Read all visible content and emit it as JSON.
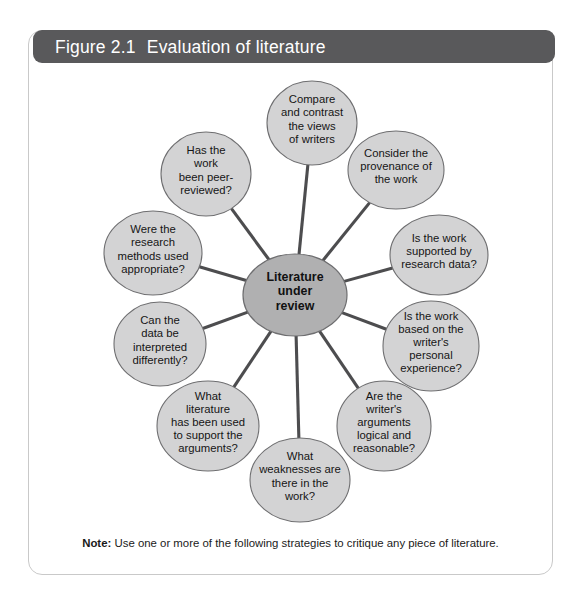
{
  "figure": {
    "title_number": "Figure 2.1",
    "title_text": "Evaluation of literature",
    "note_label": "Note:",
    "note_text": "Use one or more of the following strategies to critique any piece of literature."
  },
  "colors": {
    "title_bar": "#59595b",
    "title_text": "#ffffff",
    "frame_border": "#c9c9c9",
    "node_fill": "#d3d3d4",
    "node_stroke": "#6e6e70",
    "center_fill": "#b0b0b1",
    "spoke": "#4d4d4f",
    "page_background": "#ffffff"
  },
  "chart_data": {
    "type": "diagram",
    "diagram_kind": "radial-hub-and-spoke",
    "center": {
      "id": "literature-under-review",
      "label": "Literature under review",
      "lines": [
        "Literature",
        "under",
        "review"
      ],
      "cx": 267,
      "cy": 232,
      "rx": 52,
      "ry": 41
    },
    "nodes": [
      {
        "id": "compare-contrast-views",
        "label": "Compare and contrast the views of writers",
        "lines": [
          "Compare",
          "and contrast",
          "the views",
          "of writers"
        ],
        "angle_deg": 90,
        "cx": 284,
        "cy": 60,
        "rx": 45,
        "ry": 42
      },
      {
        "id": "consider-provenance",
        "label": "Consider the provenance of the work",
        "lines": [
          "Consider the",
          "provenance of",
          "the work"
        ],
        "angle_deg": 54,
        "cx": 368,
        "cy": 107,
        "rx": 48,
        "ry": 39
      },
      {
        "id": "supported-by-research-data",
        "label": "Is the work supported by research data?",
        "lines": [
          "Is the work",
          "supported by",
          "research data?"
        ],
        "angle_deg": 18,
        "cx": 411,
        "cy": 192,
        "rx": 49,
        "ry": 40
      },
      {
        "id": "based-on-personal-experience",
        "label": "Is the work based on the writer's personal experience?",
        "lines": [
          "Is the work",
          "based on the",
          "writer's",
          "personal",
          "experience?"
        ],
        "angle_deg": -18,
        "cx": 403,
        "cy": 283,
        "rx": 48,
        "ry": 45
      },
      {
        "id": "arguments-logical-reasonable",
        "label": "Are the writer's arguments logical and reasonable?",
        "lines": [
          "Are the",
          "writer's",
          "arguments",
          "logical and",
          "reasonable?"
        ],
        "angle_deg": -54,
        "cx": 356,
        "cy": 363,
        "rx": 47,
        "ry": 45
      },
      {
        "id": "weaknesses-in-work",
        "label": "What weaknesses are there in the work?",
        "lines": [
          "What",
          "weaknesses are",
          "there in the",
          "work?"
        ],
        "angle_deg": -90,
        "cx": 272,
        "cy": 417,
        "rx": 50,
        "ry": 42
      },
      {
        "id": "literature-supporting-arguments",
        "label": "What literature has been used to support the arguments?",
        "lines": [
          "What",
          "literature",
          "has been used",
          "to support the",
          "arguments?"
        ],
        "angle_deg": -126,
        "cx": 180,
        "cy": 363,
        "rx": 51,
        "ry": 45
      },
      {
        "id": "data-interpreted-differently",
        "label": "Can the data be interpreted differently?",
        "lines": [
          "Can the",
          "data be",
          "interpreted",
          "differently?"
        ],
        "angle_deg": -162,
        "cx": 132,
        "cy": 281,
        "rx": 46,
        "ry": 42
      },
      {
        "id": "research-methods-appropriate",
        "label": "Were the research methods used appropriate?",
        "lines": [
          "Were the",
          "research",
          "methods used",
          "appropriate?"
        ],
        "angle_deg": 162,
        "cx": 125,
        "cy": 190,
        "rx": 49,
        "ry": 42
      },
      {
        "id": "peer-reviewed",
        "label": "Has the work been peer-reviewed?",
        "lines": [
          "Has the",
          "work",
          "been peer-",
          "reviewed?"
        ],
        "angle_deg": 126,
        "cx": 178,
        "cy": 111,
        "rx": 45,
        "ry": 42
      }
    ]
  }
}
